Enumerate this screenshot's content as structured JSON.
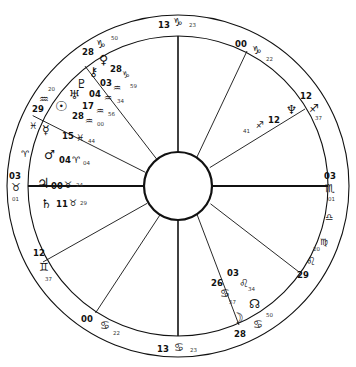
{
  "chart": {
    "type": "astrological-wheel",
    "colors": {
      "stroke": "#111111",
      "background": "#ffffff",
      "text": "#111111"
    },
    "geometry": {
      "cx": 178,
      "cy": 186,
      "r_outer": 172,
      "r_ring_inner": 150,
      "r_inner_hub": 34
    },
    "angles": {
      "ascendant": {
        "degree": "03",
        "sign": "♉",
        "sign_name": "Taurus",
        "minute": "01"
      },
      "midheaven": {
        "degree": "13",
        "sign": "♑",
        "sign_name": "Capricorn",
        "minute": "23"
      },
      "descendant": {
        "degree": "03",
        "sign": "♏",
        "sign_name": "Scorpio",
        "minute": "01"
      },
      "imum_coeli": {
        "degree": "13",
        "sign": "♋",
        "sign_name": "Cancer",
        "minute": "23"
      }
    },
    "house_cusps": [
      {
        "house": 1,
        "degree": "03",
        "sign": "♉",
        "minute": "01",
        "x": 10,
        "y": 172,
        "sx": 12,
        "sy": 183,
        "mx": 12,
        "my": 197
      },
      {
        "house": 2,
        "degree": "12",
        "sign": "♊",
        "minute": "37",
        "x": 34,
        "y": 249,
        "sx": 39,
        "sy": 264,
        "mx": 44,
        "my": 277
      },
      {
        "house": 3,
        "degree": "00",
        "sign": "♋",
        "minute": "22",
        "x": 82,
        "y": 315,
        "sx": 101,
        "sy": 322,
        "mx": 112,
        "my": 331
      },
      {
        "house": 4,
        "degree": "13",
        "sign": "♋",
        "minute": "23",
        "x": 158,
        "y": 345,
        "sx": 175,
        "sy": 347,
        "mx": 189,
        "my": 348
      },
      {
        "house": 5,
        "degree": "28",
        "sign": "♋",
        "minute": "50",
        "x": 236,
        "y": 330,
        "sx": 255,
        "sy": 321,
        "mx": 265,
        "my": 313
      },
      {
        "house": 6,
        "degree": "29",
        "sign": "♌",
        "minute": "20",
        "x": 299,
        "y": 271,
        "sx": 307,
        "sy": 258,
        "mx": 313,
        "my": 248
      },
      {
        "house": 7,
        "degree": "03",
        "sign": "♏",
        "minute": "01",
        "x": 325,
        "y": 172,
        "sx": 325,
        "sy": 184,
        "mx": 327,
        "my": 198
      },
      {
        "house": 8,
        "degree": "12",
        "sign": "♐",
        "minute": "37",
        "x": 299,
        "y": 92,
        "sx": 309,
        "sy": 104,
        "mx": 315,
        "my": 114
      },
      {
        "house": 9,
        "degree": "00",
        "sign": "♑",
        "minute": "22",
        "x": 235,
        "y": 40,
        "sx": 252,
        "sy": 47,
        "mx": 264,
        "my": 56
      },
      {
        "house": 10,
        "degree": "13",
        "sign": "♑",
        "minute": "23",
        "x": 158,
        "y": 21,
        "sx": 173,
        "sy": 19,
        "mx": 189,
        "my": 22
      },
      {
        "house": 11,
        "degree": "28",
        "sign": "♑",
        "minute": "50",
        "x": 83,
        "y": 48,
        "sx": 97,
        "sy": 40,
        "mx": 110,
        "my": 37
      },
      {
        "house": 12,
        "degree": "29",
        "sign": "♒",
        "minute": "20",
        "x": 33,
        "y": 105,
        "sx": 40,
        "sy": 96,
        "mx": 47,
        "my": 88
      }
    ],
    "sign_markers": [
      {
        "glyph": "♈",
        "name": "Aries",
        "x": 21,
        "y": 150
      },
      {
        "glyph": "♓",
        "name": "Pisces",
        "x": 29,
        "y": 123
      },
      {
        "glyph": "♎",
        "name": "Libra",
        "x": 325,
        "y": 213
      },
      {
        "glyph": "♍",
        "name": "Virgo",
        "x": 320,
        "y": 238
      }
    ],
    "planets": [
      {
        "name": "Venus",
        "glyph": "♀",
        "degree": "",
        "sign": "",
        "minute": "",
        "gx": 100,
        "gy": 57,
        "dx": 0,
        "dy": 0,
        "sx": 0,
        "sy": 0,
        "mx": 0,
        "my": 0
      },
      {
        "name": "Chiron",
        "glyph": "⚷",
        "degree": "03",
        "sign": "♒",
        "minute": "",
        "gx": 90,
        "gy": 70,
        "dx": 101,
        "dy": 78,
        "sx": 112,
        "sy": 84,
        "mx": 0,
        "my": 0
      },
      {
        "name": "Pluto",
        "glyph": "♇",
        "degree": "28",
        "sign": "♑",
        "minute": "59",
        "gx": 78,
        "gy": 81,
        "dx": 109,
        "dy": 66,
        "sx": 121,
        "sy": 74,
        "mx": 128,
        "my": 83
      },
      {
        "name": "Uranus",
        "glyph": "♅",
        "degree": "04",
        "sign": "♒",
        "minute": "34",
        "gx": 71,
        "gy": 92,
        "dx": 90,
        "dy": 89,
        "sx": 104,
        "sy": 95,
        "mx": 115,
        "my": 100
      },
      {
        "name": "Sun",
        "glyph": "☉",
        "degree": "17",
        "sign": "♒",
        "minute": "56",
        "gx": 58,
        "gy": 103,
        "dx": 83,
        "dy": 101,
        "sx": 96,
        "sy": 108,
        "mx": 106,
        "my": 112
      },
      {
        "name": "Neptune2",
        "glyph": "♆",
        "degree": "28",
        "sign": "♒",
        "minute": "00",
        "gx": 0,
        "gy": 0,
        "dx": 73,
        "dy": 112,
        "sx": 86,
        "sy": 118,
        "mx": 96,
        "my": 121
      },
      {
        "name": "Mercury",
        "glyph": "☿",
        "degree": "15",
        "sign": "♓",
        "minute": "44",
        "gx": 44,
        "gy": 127,
        "dx": 64,
        "dy": 132,
        "sx": 77,
        "sy": 136,
        "mx": 87,
        "my": 140
      },
      {
        "name": "Mars",
        "glyph": "♂",
        "degree": "04",
        "sign": "♈",
        "minute": "04",
        "gx": 47,
        "gy": 152,
        "dx": 60,
        "dy": 156,
        "sx": 71,
        "sy": 158,
        "mx": 81,
        "my": 162
      },
      {
        "name": "Jupiter",
        "glyph": "♃",
        "degree": "00",
        "sign": "♉",
        "minute": "24",
        "gx": 40,
        "gy": 183,
        "dx": 52,
        "dy": 185,
        "sx": 64,
        "sy": 186,
        "mx": 74,
        "my": 188
      },
      {
        "name": "Saturn",
        "glyph": "♄",
        "degree": "11",
        "sign": "♉",
        "minute": "29",
        "gx": 43,
        "gy": 204,
        "dx": 57,
        "dy": 204,
        "sx": 68,
        "sy": 205,
        "mx": 78,
        "my": 205
      },
      {
        "name": "NeptuneR",
        "glyph": "♆",
        "degree": "12",
        "sign": "♐",
        "minute": "41",
        "gx": 288,
        "gy": 109,
        "dx": 270,
        "dy": 120,
        "sx": 258,
        "sy": 124,
        "mx": 245,
        "my": 130
      },
      {
        "name": "NorthNode",
        "glyph": "☊",
        "degree": "",
        "sign": "",
        "minute": "",
        "gx": 250,
        "gy": 305,
        "dx": 0,
        "dy": 0,
        "sx": 0,
        "sy": 0,
        "mx": 0,
        "my": 0
      },
      {
        "name": "Moon",
        "glyph": "☽",
        "degree": "",
        "sign": "",
        "minute": "",
        "gx": 234,
        "gy": 318,
        "dx": 0,
        "dy": 0,
        "sx": 0,
        "sy": 0,
        "mx": 0,
        "my": 0
      }
    ],
    "planet_groups": [
      {
        "label": "26",
        "sign": "♋",
        "minute": "57",
        "dx": 212,
        "dy": 280,
        "sx": 222,
        "sy": 291,
        "mx": 229,
        "my": 300
      },
      {
        "label": "03",
        "sign": "♌",
        "minute": "34",
        "dx": 228,
        "dy": 272,
        "sx": 240,
        "sy": 281,
        "mx": 247,
        "my": 288
      }
    ]
  }
}
